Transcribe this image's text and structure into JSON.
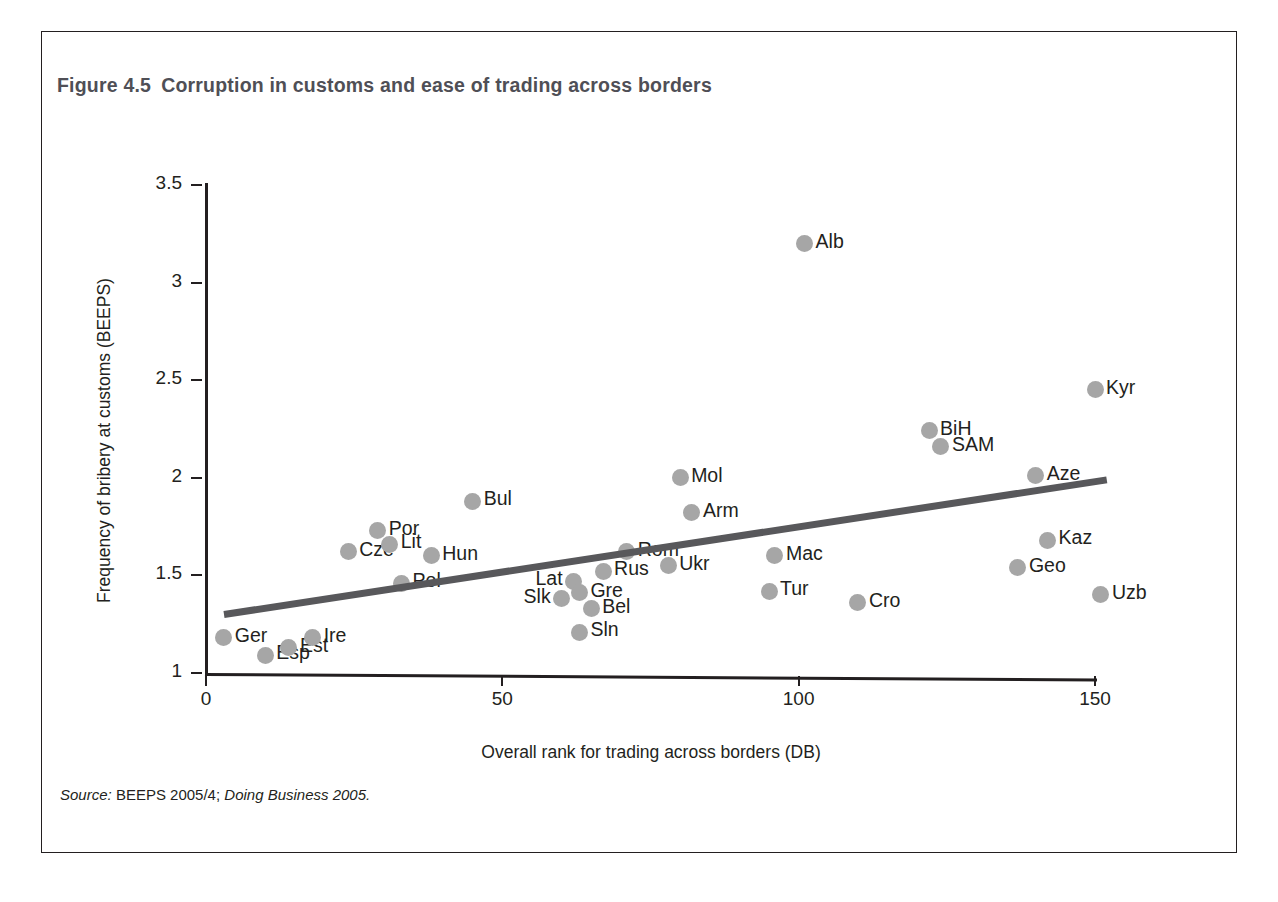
{
  "figure": {
    "number": "Figure 4.5",
    "title": "Corruption in customs and ease of trading across borders",
    "source": "Source: BEEPS 2005/4; Doing Business 2005.",
    "source_prefix": "Source:",
    "source_body": "BEEPS 2005/4;",
    "source_italic": "Doing Business 2005."
  },
  "chart_data": {
    "type": "scatter",
    "title": "Corruption in customs and ease of trading across borders",
    "xlabel": "Overall rank for trading across borders (DB)",
    "ylabel": "Frequency of bribery at customs (BEEPS)",
    "xlim": [
      0,
      155
    ],
    "ylim": [
      0.85,
      3.5
    ],
    "xticks": [
      0,
      50,
      100,
      150
    ],
    "yticks": [
      1,
      1.5,
      2,
      2.5,
      3,
      3.5
    ],
    "xtick_labels": [
      "0",
      "50",
      "100",
      "150"
    ],
    "ytick_labels": [
      "1",
      "1.5",
      "2",
      "2.5",
      "3",
      "3.5"
    ],
    "grid": false,
    "legend": "none",
    "marker_color": "#a6a6a6",
    "trendline_color": "#58585b",
    "axis_color": "#231f20",
    "trendline": {
      "x0": 3,
      "y0": 1.3,
      "x1": 152,
      "y1": 1.99
    },
    "points": [
      {
        "label": "Ger",
        "x": 3,
        "y": 1.18,
        "label_pos": "right"
      },
      {
        "label": "Esp",
        "x": 10,
        "y": 1.09,
        "label_pos": "right"
      },
      {
        "label": "Est",
        "x": 14,
        "y": 1.13,
        "label_pos": "right"
      },
      {
        "label": "Ire",
        "x": 18,
        "y": 1.18,
        "label_pos": "right"
      },
      {
        "label": "Cze",
        "x": 24,
        "y": 1.62,
        "label_pos": "right"
      },
      {
        "label": "Por",
        "x": 29,
        "y": 1.73,
        "label_pos": "right"
      },
      {
        "label": "Lit",
        "x": 31,
        "y": 1.66,
        "label_pos": "right"
      },
      {
        "label": "Pol",
        "x": 33,
        "y": 1.46,
        "label_pos": "right"
      },
      {
        "label": "Hun",
        "x": 38,
        "y": 1.6,
        "label_pos": "right"
      },
      {
        "label": "Bul",
        "x": 45,
        "y": 1.88,
        "label_pos": "right"
      },
      {
        "label": "Slk",
        "x": 60,
        "y": 1.38,
        "label_pos": "left"
      },
      {
        "label": "Lat",
        "x": 62,
        "y": 1.47,
        "label_pos": "left"
      },
      {
        "label": "Gre",
        "x": 63,
        "y": 1.41,
        "label_pos": "right"
      },
      {
        "label": "Sln",
        "x": 63,
        "y": 1.21,
        "label_pos": "right"
      },
      {
        "label": "Bel",
        "x": 65,
        "y": 1.33,
        "label_pos": "right"
      },
      {
        "label": "Rus",
        "x": 67,
        "y": 1.52,
        "label_pos": "right"
      },
      {
        "label": "Rom",
        "x": 71,
        "y": 1.62,
        "label_pos": "right"
      },
      {
        "label": "Ukr",
        "x": 78,
        "y": 1.55,
        "label_pos": "right"
      },
      {
        "label": "Mol",
        "x": 80,
        "y": 2.0,
        "label_pos": "right"
      },
      {
        "label": "Arm",
        "x": 82,
        "y": 1.82,
        "label_pos": "right"
      },
      {
        "label": "Alb",
        "x": 101,
        "y": 3.2,
        "label_pos": "right"
      },
      {
        "label": "Mac",
        "x": 96,
        "y": 1.6,
        "label_pos": "right"
      },
      {
        "label": "Tur",
        "x": 95,
        "y": 1.42,
        "label_pos": "right"
      },
      {
        "label": "Cro",
        "x": 110,
        "y": 1.36,
        "label_pos": "right"
      },
      {
        "label": "BiH",
        "x": 122,
        "y": 2.24,
        "label_pos": "right"
      },
      {
        "label": "SAM",
        "x": 124,
        "y": 2.16,
        "label_pos": "right"
      },
      {
        "label": "Geo",
        "x": 137,
        "y": 1.54,
        "label_pos": "right"
      },
      {
        "label": "Aze",
        "x": 140,
        "y": 2.01,
        "label_pos": "right"
      },
      {
        "label": "Kaz",
        "x": 142,
        "y": 1.68,
        "label_pos": "right"
      },
      {
        "label": "Kyr",
        "x": 150,
        "y": 2.45,
        "label_pos": "right"
      },
      {
        "label": "Uzb",
        "x": 151,
        "y": 1.4,
        "label_pos": "right"
      }
    ]
  }
}
